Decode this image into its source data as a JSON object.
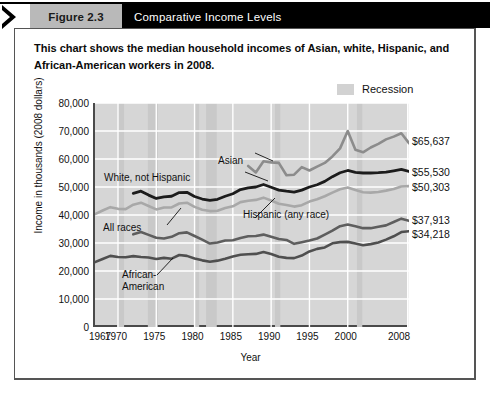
{
  "header": {
    "figure_tag": "Figure 2.3",
    "title": "Comparative Income Levels",
    "chevron_icon": "chevron-right-icon"
  },
  "caption": "This chart shows the median household incomes of Asian, white, Hispanic, and African-American workers in 2008.",
  "legend": {
    "swatch_color": "#d2d2d2",
    "label": "Recession",
    "position": "top-right"
  },
  "chart_data": {
    "type": "line",
    "title": "Comparative Income Levels",
    "xlabel": "Year",
    "ylabel": "Income in thousands (2008 dollars)",
    "xlim": [
      1967,
      2008
    ],
    "ylim": [
      0,
      80000
    ],
    "grid": true,
    "xticks": [
      "1967",
      "1970",
      "1975",
      "1980",
      "1985",
      "1990",
      "1995",
      "2000",
      "2008"
    ],
    "xtick_values": [
      1967,
      1970,
      1975,
      1980,
      1985,
      1990,
      1995,
      2000,
      2008
    ],
    "yticks": [
      "0",
      "10,000",
      "20,000",
      "30,000",
      "40,000",
      "50,000",
      "60,000",
      "70,000",
      "80,000"
    ],
    "ytick_values": [
      0,
      10000,
      20000,
      30000,
      40000,
      50000,
      60000,
      70000,
      80000
    ],
    "recession_bands": [
      [
        1969.9,
        1970.8
      ],
      [
        1973.9,
        1975.2
      ],
      [
        1980.0,
        1980.6
      ],
      [
        1981.5,
        1982.9
      ],
      [
        1990.5,
        1991.2
      ],
      [
        2001.2,
        2001.9
      ],
      [
        2007.9,
        2008.0
      ]
    ],
    "series": [
      {
        "name": "Asian",
        "color": "#8c8c8c",
        "width": 2.6,
        "x": [
          1987,
          1988,
          1989,
          1990,
          1991,
          1992,
          1993,
          1994,
          1995,
          1996,
          1997,
          1998,
          1999,
          2000,
          2001,
          2002,
          2003,
          2004,
          2005,
          2006,
          2007,
          2008
        ],
        "values": [
          57500,
          55200,
          59200,
          58800,
          58600,
          54200,
          54400,
          57100,
          55900,
          57300,
          58600,
          60900,
          63800,
          70000,
          63300,
          62400,
          64100,
          65400,
          67000,
          68000,
          69200,
          65637
        ]
      },
      {
        "name": "White, not Hispanic",
        "color": "#1c1c1c",
        "width": 2.8,
        "x": [
          1972,
          1973,
          1974,
          1975,
          1976,
          1977,
          1978,
          1979,
          1980,
          1981,
          1982,
          1983,
          1984,
          1985,
          1986,
          1987,
          1988,
          1989,
          1990,
          1991,
          1992,
          1993,
          1994,
          1995,
          1996,
          1997,
          1998,
          1999,
          2000,
          2001,
          2002,
          2003,
          2004,
          2005,
          2006,
          2007,
          2008
        ],
        "values": [
          47700,
          48500,
          47100,
          45900,
          46500,
          46700,
          48000,
          48100,
          46600,
          45700,
          45200,
          45600,
          46700,
          47600,
          49100,
          49700,
          50000,
          50900,
          49900,
          48900,
          48500,
          48200,
          48900,
          50000,
          50800,
          52000,
          53700,
          55100,
          55900,
          55200,
          55000,
          55000,
          55100,
          55300,
          55800,
          56300,
          55530
        ]
      },
      {
        "name": "All races",
        "color": "#a8a8a8",
        "width": 2.6,
        "x": [
          1967,
          1968,
          1969,
          1970,
          1971,
          1972,
          1973,
          1974,
          1975,
          1976,
          1977,
          1978,
          1979,
          1980,
          1981,
          1982,
          1983,
          1984,
          1985,
          1986,
          1987,
          1988,
          1989,
          1990,
          1991,
          1992,
          1993,
          1994,
          1995,
          1996,
          1997,
          1998,
          1999,
          2000,
          2001,
          2002,
          2003,
          2004,
          2005,
          2006,
          2007,
          2008
        ],
        "values": [
          40300,
          41600,
          42800,
          42200,
          42100,
          43700,
          44400,
          43200,
          42000,
          42700,
          42700,
          44100,
          44400,
          42900,
          41900,
          41400,
          41500,
          42500,
          43100,
          44600,
          45100,
          45400,
          46200,
          45200,
          44000,
          43600,
          43000,
          43500,
          44800,
          45600,
          46700,
          48000,
          49200,
          49800,
          48900,
          48100,
          48000,
          48200,
          48700,
          49300,
          50200,
          50303
        ]
      },
      {
        "name": "Hispanic (any race)",
        "color": "#5e5e5e",
        "width": 2.6,
        "x": [
          1972,
          1973,
          1974,
          1975,
          1976,
          1977,
          1978,
          1979,
          1980,
          1981,
          1982,
          1983,
          1984,
          1985,
          1986,
          1987,
          1988,
          1989,
          1990,
          1991,
          1992,
          1993,
          1994,
          1995,
          1996,
          1997,
          1998,
          1999,
          2000,
          2001,
          2002,
          2003,
          2004,
          2005,
          2006,
          2007,
          2008
        ],
        "values": [
          33100,
          33900,
          32900,
          31900,
          31600,
          32200,
          33500,
          33800,
          32500,
          31200,
          29800,
          30200,
          30900,
          31000,
          31800,
          32400,
          32500,
          33000,
          32200,
          31400,
          31100,
          29700,
          30300,
          30900,
          31600,
          33000,
          34400,
          36000,
          36600,
          36000,
          35300,
          35300,
          35800,
          36300,
          37500,
          38700,
          37913
        ]
      },
      {
        "name": "African-American",
        "color": "#4f4f4f",
        "width": 2.6,
        "x": [
          1967,
          1968,
          1969,
          1970,
          1971,
          1972,
          1973,
          1974,
          1975,
          1976,
          1977,
          1978,
          1979,
          1980,
          1981,
          1982,
          1983,
          1984,
          1985,
          1986,
          1987,
          1988,
          1989,
          1990,
          1991,
          1992,
          1993,
          1994,
          1995,
          1996,
          1997,
          1998,
          1999,
          2000,
          2001,
          2002,
          2003,
          2004,
          2005,
          2006,
          2007,
          2008
        ],
        "values": [
          23200,
          24300,
          25400,
          25000,
          24900,
          25300,
          25000,
          24800,
          24300,
          24700,
          24400,
          25700,
          25400,
          24500,
          23800,
          23300,
          23700,
          24400,
          25200,
          25800,
          26000,
          26100,
          26800,
          26100,
          25100,
          24700,
          24600,
          25500,
          27000,
          27900,
          28400,
          29900,
          30300,
          30400,
          29800,
          29200,
          29600,
          30200,
          31200,
          32400,
          33900,
          34218
        ]
      }
    ],
    "end_labels": [
      {
        "series": "Asian",
        "text": "$65,637",
        "value": 65637
      },
      {
        "series": "White, not Hispanic",
        "text": "$55,530",
        "value": 55530
      },
      {
        "series": "All races",
        "text": "$50,303",
        "value": 50303
      },
      {
        "series": "Hispanic (any race)",
        "text": "$37,913",
        "value": 37913
      },
      {
        "series": "African-American",
        "text": "$34,218",
        "value": 34218
      }
    ],
    "annotations": [
      {
        "text": "Asian",
        "x": 218,
        "y": 155
      },
      {
        "text": "White, not Hispanic",
        "x": 104,
        "y": 172
      },
      {
        "text": "All races",
        "x": 103,
        "y": 222
      },
      {
        "text": "Hispanic (any race)",
        "x": 243,
        "y": 209
      },
      {
        "text": "African-",
        "x": 122,
        "y": 269
      },
      {
        "text": "American",
        "x": 122,
        "y": 281
      }
    ]
  }
}
